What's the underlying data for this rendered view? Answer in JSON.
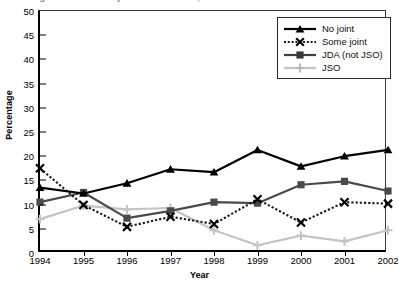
{
  "title": "Figure: Trends in joint attendance, 1994-2002",
  "axis": {
    "ylabel": "Percentage",
    "xlabel": "Year",
    "yticks": [
      "0",
      "5",
      "10",
      "15",
      "20",
      "25",
      "30",
      "35",
      "40",
      "45",
      "50"
    ],
    "xticks": [
      "1994",
      "1995",
      "1996",
      "1997",
      "1998",
      "1999",
      "2000",
      "2001",
      "2002"
    ]
  },
  "legend": {
    "items": [
      {
        "label": "No joint",
        "color": "#000000",
        "marker": "triangle",
        "dashed": false
      },
      {
        "label": "Some joint",
        "color": "#1a1a1a",
        "marker": "cross",
        "dashed": true
      },
      {
        "label": "JDA (not JSO)",
        "color": "#4a4a4a",
        "marker": "square",
        "dashed": false
      },
      {
        "label": "JSO",
        "color": "#c4c4c4",
        "marker": "plus",
        "dashed": false
      }
    ]
  },
  "chart_data": {
    "type": "line",
    "title": "Figure: Trends in joint attendance, 1994-2002",
    "xlabel": "Year",
    "ylabel": "Percentage",
    "categories": [
      "1994",
      "1995",
      "1996",
      "1997",
      "1998",
      "1999",
      "2000",
      "2001",
      "2002"
    ],
    "ylim": [
      0,
      50
    ],
    "ytick_step": 5,
    "grid": false,
    "legend_position": "top-right",
    "series": [
      {
        "name": "No joint",
        "values": [
          13.5,
          12.3,
          14.4,
          17.3,
          16.7,
          21.3,
          17.9,
          20.0,
          21.3
        ]
      },
      {
        "name": "Some joint",
        "values": [
          17.5,
          9.9,
          5.4,
          7.5,
          6.0,
          11.1,
          6.3,
          10.5,
          10.2
        ]
      },
      {
        "name": "JDA (not JSO)",
        "values": [
          10.5,
          12.5,
          7.2,
          8.7,
          10.5,
          10.3,
          14.1,
          14.8,
          12.8
        ]
      },
      {
        "name": "JSO",
        "values": [
          7.0,
          9.8,
          9.0,
          9.3,
          4.7,
          1.6,
          3.6,
          2.4,
          4.7
        ]
      }
    ]
  }
}
